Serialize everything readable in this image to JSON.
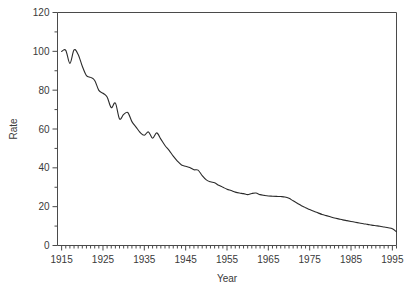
{
  "chart_data": {
    "type": "line",
    "title": "",
    "xlabel": "Year",
    "ylabel": "Rate",
    "xlim": [
      1914,
      1996
    ],
    "ylim": [
      0,
      120
    ],
    "grid": false,
    "legend": null,
    "x_ticklabels": [
      "1915",
      "1925",
      "1935",
      "1945",
      "1955",
      "1965",
      "1975",
      "1985",
      "1995"
    ],
    "x_tickvalues": [
      1915,
      1925,
      1935,
      1945,
      1955,
      1965,
      1975,
      1985,
      1995
    ],
    "x_minor_tick_step": 1,
    "y_ticklabels": [
      "0",
      "20",
      "40",
      "60",
      "80",
      "100",
      "120"
    ],
    "y_tickvalues": [
      0,
      20,
      40,
      60,
      80,
      100,
      120
    ],
    "y_minor_tick_step": 10,
    "line_color": "#2b2b2b",
    "axis_color": "#4a4a4a",
    "series": [
      {
        "name": "Rate",
        "x": [
          1915,
          1916,
          1917,
          1918,
          1919,
          1920,
          1921,
          1922,
          1923,
          1924,
          1925,
          1926,
          1927,
          1928,
          1929,
          1930,
          1931,
          1932,
          1933,
          1934,
          1935,
          1936,
          1937,
          1938,
          1939,
          1940,
          1941,
          1942,
          1943,
          1944,
          1945,
          1946,
          1947,
          1948,
          1949,
          1950,
          1951,
          1952,
          1953,
          1954,
          1955,
          1956,
          1957,
          1958,
          1959,
          1960,
          1961,
          1962,
          1963,
          1964,
          1965,
          1966,
          1967,
          1968,
          1969,
          1970,
          1971,
          1972,
          1973,
          1974,
          1975,
          1976,
          1977,
          1978,
          1979,
          1980,
          1981,
          1982,
          1983,
          1984,
          1985,
          1986,
          1987,
          1988,
          1989,
          1990,
          1991,
          1992,
          1993,
          1994,
          1995,
          1996
        ],
        "values": [
          99.9,
          100.5,
          93.8,
          100.7,
          98.4,
          92.3,
          87.5,
          86.6,
          85.0,
          79.9,
          78.4,
          76.5,
          71.0,
          73.4,
          65.2,
          67.5,
          68.5,
          63.8,
          61.0,
          58.2,
          56.8,
          58.5,
          55.2,
          58.0,
          54.8,
          51.5,
          49.0,
          46.0,
          43.5,
          41.5,
          40.8,
          40.2,
          39.0,
          38.8,
          36.0,
          33.8,
          32.8,
          32.3,
          31.0,
          30.0,
          29.0,
          28.3,
          27.5,
          27.0,
          26.7,
          26.2,
          26.8,
          27.0,
          26.2,
          25.8,
          25.5,
          25.4,
          25.3,
          25.2,
          25.0,
          24.3,
          23.0,
          21.8,
          20.5,
          19.5,
          18.5,
          17.6,
          16.8,
          16.0,
          15.4,
          14.8,
          14.2,
          13.7,
          13.2,
          12.8,
          12.4,
          12.0,
          11.6,
          11.2,
          10.9,
          10.5,
          10.2,
          9.9,
          9.5,
          9.1,
          8.6,
          7.1
        ]
      }
    ]
  },
  "axis_titles": {
    "x": "Year",
    "y": "Rate"
  }
}
